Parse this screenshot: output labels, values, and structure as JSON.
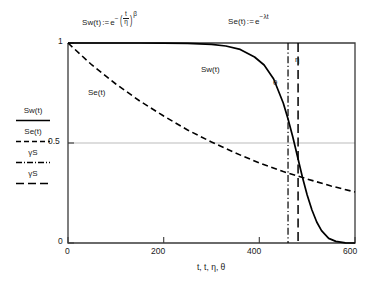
{
  "chart_data": {
    "type": "line",
    "title": "",
    "xlabel": "t, t, η, θ",
    "ylabel": "",
    "xlim": [
      0,
      600
    ],
    "ylim": [
      0,
      1
    ],
    "xticks": [
      "0",
      "200",
      "400",
      "600"
    ],
    "xtick_values": [
      0,
      200,
      400,
      600
    ],
    "yticks": [
      "0",
      "0.5",
      "1"
    ],
    "ytick_values": [
      0,
      0.5,
      1
    ],
    "grid": "horizontal gridline at y=0.5 only",
    "legend_position": "left of y-axis",
    "series": [
      {
        "name": "Sw(t)",
        "style": "solid",
        "color": "#000000",
        "formula": "Sw(t) := e^-(t/η)^β",
        "x": [
          0,
          50,
          100,
          150,
          200,
          250,
          300,
          330,
          360,
          390,
          410,
          430,
          450,
          460,
          470,
          480,
          490,
          500,
          510,
          520,
          530,
          545,
          560,
          580,
          600
        ],
        "y": [
          1.0,
          1.0,
          1.0,
          1.0,
          0.999,
          0.998,
          0.993,
          0.985,
          0.968,
          0.93,
          0.89,
          0.82,
          0.7,
          0.62,
          0.53,
          0.43,
          0.33,
          0.24,
          0.165,
          0.105,
          0.062,
          0.023,
          0.008,
          0.001,
          0.0
        ]
      },
      {
        "name": "Se(t)",
        "style": "dashed",
        "color": "#000000",
        "formula": "Se(t) := e^-λt",
        "x": [
          0,
          50,
          100,
          150,
          200,
          250,
          300,
          350,
          400,
          450,
          480,
          500,
          550,
          600
        ],
        "y": [
          1.0,
          0.89,
          0.795,
          0.71,
          0.635,
          0.565,
          0.505,
          0.45,
          0.4,
          0.357,
          0.335,
          0.32,
          0.285,
          0.255
        ]
      }
    ],
    "vlines": [
      {
        "name": "θ",
        "label": "θ",
        "x": 460,
        "style": "dash-dot"
      },
      {
        "name": "η",
        "label": "η",
        "x": 481,
        "style": "long-dash"
      }
    ],
    "annotations": [
      {
        "name": "curve-label-sw",
        "text": "Sw(t)"
      },
      {
        "name": "curve-label-se",
        "text": "Se(t)"
      }
    ]
  },
  "equations": {
    "weibull": {
      "fn": "Sw(t)",
      "assign": ":=",
      "base": "e",
      "exp_sign": "−",
      "num": "t",
      "den": "η",
      "power": "β"
    },
    "exponential": {
      "fn": "Se(t)",
      "assign": ":=",
      "base": "e",
      "exponent": "−λt"
    }
  },
  "legend": {
    "items": [
      {
        "label": "Sw(t)",
        "style": "solid"
      },
      {
        "label": "Se(t)",
        "style": "dashed"
      },
      {
        "label": "γS",
        "style": "dash-dot"
      },
      {
        "label": "γS",
        "style": "long-dash"
      }
    ]
  },
  "axes": {
    "y_ticks": [
      "1",
      "0.5",
      "0"
    ],
    "x_ticks": [
      "0",
      "200",
      "400",
      "600"
    ],
    "x_label": "t, t, η, θ"
  },
  "plot_annotations": {
    "sw_curve": "Sw(t)",
    "se_curve": "Se(t)",
    "theta": "θ",
    "eta": "η"
  },
  "colors": {
    "line": "#000000",
    "gridline": "#b0b0b0",
    "axis": "#333333",
    "background": "#ffffff"
  }
}
